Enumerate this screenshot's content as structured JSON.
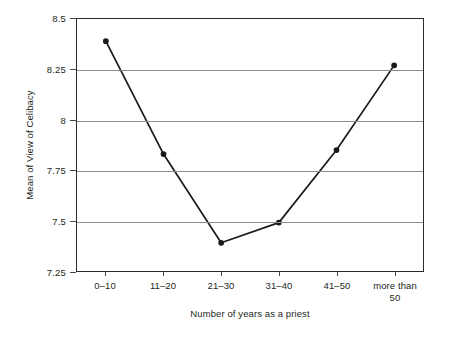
{
  "chart_data": {
    "type": "line",
    "title": "",
    "xlabel": "Number of years as a priest",
    "ylabel": "Mean of View of Celibacy",
    "categories": [
      "0–10",
      "11–20",
      "21–30",
      "31–40",
      "41–50",
      "more than\n50"
    ],
    "series": [
      {
        "name": "Mean of View of Celibacy",
        "values": [
          8.39,
          7.83,
          7.39,
          7.49,
          7.85,
          8.27
        ],
        "marker": "filled-circle",
        "color": "#1a1a1a"
      }
    ],
    "ylim": [
      7.25,
      8.5
    ],
    "yticks": [
      "7.25",
      "7.5",
      "7.75",
      "8",
      "8.25",
      "8.5"
    ],
    "ytick_values": [
      7.25,
      7.5,
      7.75,
      8,
      8.25,
      8.5
    ],
    "grid": "horizontal",
    "grid_color": "#8d8d8d",
    "legend": "none",
    "axis_color": "#2b2b2b",
    "background": "#ffffff"
  }
}
